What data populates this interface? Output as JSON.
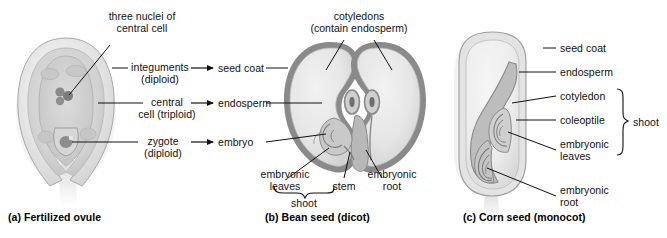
{
  "figure": {
    "background": "#ffffff",
    "ink": "#111111",
    "palette": {
      "outline": "#6f6f6f",
      "seed_coat_gray": "#8a8a8a",
      "tissue_light": "#ededed",
      "tissue_mid": "#d9d9d9",
      "tissue_dark": "#b4b4b4",
      "nucleus": "#777777",
      "leader_line": "#111111"
    }
  },
  "panel_a": {
    "caption": "(a) Fertilized ovule",
    "labels": {
      "three_nuclei": "three nuclei of\ncentral cell",
      "integuments": "integuments\n(diploid)",
      "central_cell": "central\ncell (triploid)",
      "zygote": "zygote\n(diploid)"
    }
  },
  "transition": {
    "arrows": [
      {
        "from": "integuments",
        "to": "seed coat"
      },
      {
        "from": "central cell (triploid)",
        "to": "endosperm"
      },
      {
        "from": "zygote (diploid)",
        "to": "embryo"
      }
    ],
    "targets": {
      "seed_coat": "seed coat",
      "endosperm": "endosperm",
      "embryo": "embryo"
    }
  },
  "panel_b": {
    "caption": "(b) Bean seed (dicot)",
    "labels": {
      "cotyledons": "cotyledons\n(contain endosperm)",
      "embryonic_leaves": "embryonic\nleaves",
      "stem": "stem",
      "embryonic_root": "embryonic\nroot",
      "shoot": "shoot"
    }
  },
  "panel_c": {
    "caption": "(c) Corn seed (monocot)",
    "labels": {
      "seed_coat": "seed coat",
      "endosperm": "endosperm",
      "cotyledon": "cotyledon",
      "coleoptile": "coleoptile",
      "embryonic_leaves": "embryonic\nleaves",
      "embryonic_root": "embryonic\nroot",
      "shoot": "shoot"
    }
  }
}
